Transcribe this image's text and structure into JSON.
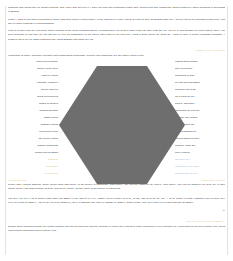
{
  "document": {
    "title": "Essay page with hexagon graphic",
    "page_number": "28"
  },
  "colors": {
    "gold_heading": "#d9bb7a",
    "blue_heading": "#9fb6cf",
    "body_text": "#333333",
    "hexagon_fill": "#6e6e6e",
    "page_background": "#ffffff",
    "margin_rule": "#e2e2e2"
  },
  "top_section": {
    "paragraphs": [
      "Grammar and idioms may be another difficulty. But I have also got over it. I have not read lots of grammar books. But I spent much time reading the articles written by native speakers or specialists in English.",
      "Finally, I want to say that overcoming all these difficulties require perseverance. In the past seven years I spent at least an hour on English each day. I believe this is an important reason why I am able to make progress in learning English.",
      "Most of us have had an experience which reminds us the world is getting smaller. Perhaps when you went to some place far away from the city you live in and thought you knew nobody there, you were surprised to find that you ran into one of your old classmates on the street! Then both of you cried out, \"What a small world!\" By doing so, I came to gain \"a sense of English language\". I began to get a feel for which sentences are \"good English\" and which are not."
    ]
  },
  "knowledge_section": {
    "heading": "Compile these sentences",
    "intro": "Knowledge is power, especially scientific and technological knowledge. Science and technology are the motive power of the",
    "left_column": [
      "social development,",
      "society could never",
      "However, social",
      "essential. Without it",
      "society and con",
      "social development",
      "unable to Spoken",
      "besides scientific",
      "master social",
      "software means",
      "developers of the",
      "the former erodes",
      "original counterpart",
      "pirated movies attract"
    ],
    "left_column_gold": [
      "Grammar",
      "be another",
      "To meet new"
    ],
    "right_column": [
      "Without them human",
      "have developed.",
      "knowledge is also",
      "we can not understand",
      "know the law of the",
      "for a result we are",
      "society. Therefore,",
      "knowledge we need to",
      "process. The pirated",
      "a great loss to the",
      "original software so",
      "marked shares of their",
      "Similarly, when the",
      "more viewers."
    ],
    "right_column_blue": [
      "and there are",
      "challenges in the 21st",
      "students should lose"
    ]
  },
  "money_section": {
    "heading": "happiness? Various",
    "heading_left": "Can money buy",
    "paragraphs": [
      "people have various answers. Some people think that money is the source of happiness. With money, one can buy whatever he enjoys. With money, one can do whatever he likes. So, in their minds, money can bring comfort, security, and so on. Money, as they think, is the source of happiness.",
      "But there are still a lot of others who think that money is the root of all evil. Money drives people to steal, to rob, and to break the law. A lot of people became criminals just because they were in search of money. And in the Western countries, there is nothing that can't be bought by money. Many people lose their own lives when hunting for money."
    ]
  },
  "closing_section": {
    "heading": "Can love have plenty of money?",
    "paragraph": "Despite these seeming benefits, the pirated software and movies should be banned, because by nature they represent unfair competition in our economic life, encouraged to left out of control, they would upset normal competition and eventually lead"
  },
  "hexagon": {
    "name": "hexagon-shape",
    "fill": "#6e6e6e",
    "points": "39,2 89,2 127,61 89,120 39,120 1,61"
  }
}
